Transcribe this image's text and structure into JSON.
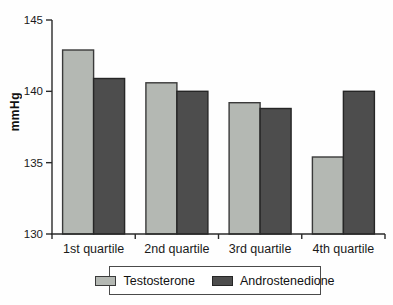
{
  "chart_data": {
    "type": "bar",
    "title": "",
    "categories": [
      "1st quartile",
      "2nd quartile",
      "3rd quartile",
      "4th quartile"
    ],
    "series": [
      {
        "name": "Testosterone",
        "color": "#b4b8b3",
        "border": "#3a3a3a",
        "values": [
          142.9,
          140.6,
          139.2,
          135.4
        ]
      },
      {
        "name": "Androstenedione",
        "color": "#4d4d4d",
        "border": "#262626",
        "values": [
          140.9,
          140.0,
          138.8,
          140.0
        ]
      }
    ],
    "xlabel": "",
    "ylabel": "mmHg",
    "ylim": [
      130,
      145
    ],
    "yticks": [
      130,
      135,
      140,
      145
    ],
    "grid": false,
    "legend_position": "bottom"
  }
}
